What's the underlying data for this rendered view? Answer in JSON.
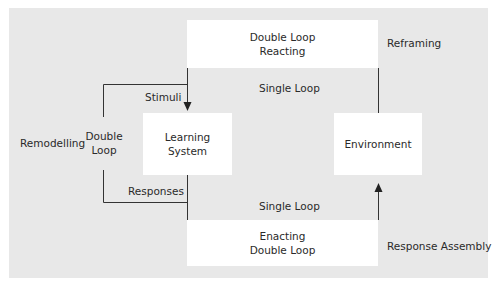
{
  "diagram": {
    "boxes": {
      "top": {
        "line1": "Double Loop",
        "line2": "Reacting"
      },
      "learning": {
        "line1": "Learning",
        "line2": "System"
      },
      "environment": {
        "line1": "Environment"
      },
      "bottom": {
        "line1": "Enacting",
        "line2": "Double Loop"
      }
    },
    "labels": {
      "reframing": "Reframing",
      "single_loop_top": "Single Loop",
      "single_loop_bottom": "Single Loop",
      "stimuli": "Stimuli",
      "responses": "Responses",
      "remodelling": "Remodelling",
      "double_loop_left_line1": "Double",
      "double_loop_left_line2": "Loop",
      "response_assembly": "Response Assembly"
    },
    "colors": {
      "background": "#e8e8e8",
      "box": "#ffffff",
      "line": "#333333",
      "text": "#2a2a2a"
    }
  }
}
